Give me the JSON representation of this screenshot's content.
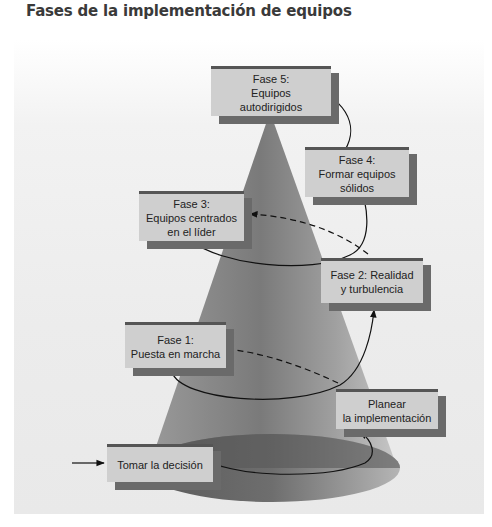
{
  "title": "Fases de la implementación de equipos",
  "diagram": {
    "type": "cone-spiral",
    "phases": [
      {
        "id": "start",
        "lines": [
          "Tomar la decisión"
        ]
      },
      {
        "id": "plan",
        "lines": [
          "Planear",
          "la implementación"
        ]
      },
      {
        "id": "phase1",
        "lines": [
          "Fase 1:",
          "Puesta en marcha"
        ]
      },
      {
        "id": "phase2",
        "lines": [
          "Fase 2: Realidad",
          "y turbulencia"
        ]
      },
      {
        "id": "phase3",
        "lines": [
          "Fase 3:",
          "Equipos centrados",
          "en el líder"
        ]
      },
      {
        "id": "phase4",
        "lines": [
          "Fase 4:",
          "Formar equipos",
          "sólidos"
        ]
      },
      {
        "id": "phase5",
        "lines": [
          "Fase 5:",
          "Equipos",
          "autodirigidos"
        ]
      }
    ],
    "colors": {
      "box_fill": "#cfcfcf",
      "box_shadow": "#6a6a6a",
      "cone_dark": "#5e5e5e",
      "cone_light": "#b8b8b8"
    }
  }
}
